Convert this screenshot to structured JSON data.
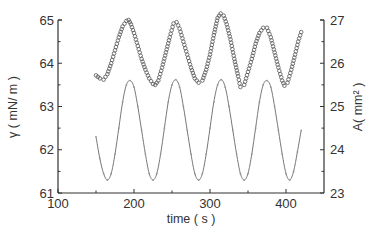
{
  "chart_data": {
    "type": "line",
    "title": "",
    "xlabel": "time ( s )",
    "ylabel_left": "γ ( mN/ m )",
    "ylabel_right": "A( mm² )",
    "xlim": [
      100,
      450
    ],
    "ylim_left": [
      61,
      65
    ],
    "ylim_right": [
      23,
      27
    ],
    "x_ticks": [
      100,
      200,
      300,
      400
    ],
    "y_left_ticks": [
      61,
      62,
      63,
      64,
      65
    ],
    "y_right_ticks": [
      23,
      24,
      25,
      26,
      27
    ],
    "grid": false,
    "legend": null,
    "series": [
      {
        "name": "surface tension γ",
        "axis": "left",
        "marker": "open-circle",
        "color": "#555555",
        "x": [
          150,
          155,
          160,
          165,
          170,
          175,
          180,
          185,
          190,
          193,
          196,
          200,
          205,
          210,
          215,
          220,
          225,
          228,
          232,
          237,
          242,
          247,
          252,
          256,
          260,
          265,
          270,
          275,
          280,
          285,
          290,
          295,
          300,
          305,
          310,
          314,
          318,
          322,
          327,
          332,
          337,
          340,
          345,
          350,
          355,
          360,
          365,
          370,
          375,
          380,
          385,
          390,
          395,
          398,
          402,
          407,
          412,
          416,
          420
        ],
        "y": [
          63.72,
          63.65,
          63.62,
          63.75,
          64.0,
          64.3,
          64.6,
          64.85,
          64.98,
          65.0,
          64.9,
          64.7,
          64.4,
          64.1,
          63.85,
          63.65,
          63.52,
          63.5,
          63.6,
          63.9,
          64.25,
          64.6,
          64.92,
          64.95,
          64.8,
          64.5,
          64.2,
          63.9,
          63.65,
          63.55,
          63.6,
          63.85,
          64.2,
          64.65,
          65.05,
          65.15,
          65.1,
          64.9,
          64.55,
          64.1,
          63.7,
          63.45,
          63.5,
          63.8,
          64.1,
          64.45,
          64.7,
          64.82,
          64.82,
          64.6,
          64.25,
          63.9,
          63.6,
          63.48,
          63.55,
          63.85,
          64.2,
          64.5,
          64.72
        ]
      },
      {
        "name": "area A",
        "axis": "right",
        "marker": "small-tick",
        "color": "#777777",
        "x": [
          150,
          155,
          160,
          165,
          170,
          175,
          180,
          185,
          190,
          195,
          200,
          205,
          210,
          215,
          220,
          225,
          230,
          235,
          240,
          245,
          250,
          255,
          260,
          265,
          270,
          275,
          280,
          285,
          290,
          295,
          300,
          305,
          310,
          315,
          320,
          325,
          330,
          335,
          340,
          345,
          350,
          355,
          360,
          365,
          370,
          375,
          380,
          385,
          390,
          395,
          400,
          405,
          410,
          415,
          420
        ],
        "y": [
          24.3,
          23.8,
          23.45,
          23.3,
          23.45,
          23.9,
          24.5,
          25.1,
          25.5,
          25.6,
          25.45,
          25.0,
          24.45,
          23.9,
          23.45,
          23.3,
          23.45,
          23.9,
          24.5,
          25.1,
          25.5,
          25.62,
          25.45,
          25.0,
          24.45,
          23.9,
          23.45,
          23.3,
          23.45,
          23.9,
          24.5,
          25.1,
          25.5,
          25.62,
          25.45,
          25.0,
          24.45,
          23.9,
          23.45,
          23.3,
          23.45,
          23.9,
          24.5,
          25.1,
          25.5,
          25.6,
          25.45,
          25.0,
          24.45,
          23.9,
          23.45,
          23.3,
          23.5,
          23.95,
          24.45
        ]
      }
    ]
  },
  "axes": {
    "x_title": "time ( s )",
    "y_left_title": "γ ( mN/ m )",
    "y_right_title": "A( mm² )",
    "x_tick_labels": [
      "100",
      "200",
      "300",
      "400"
    ],
    "y_left_tick_labels": [
      "61",
      "62",
      "63",
      "64",
      "65"
    ],
    "y_right_tick_labels": [
      "23",
      "24",
      "25",
      "26",
      "27"
    ]
  }
}
